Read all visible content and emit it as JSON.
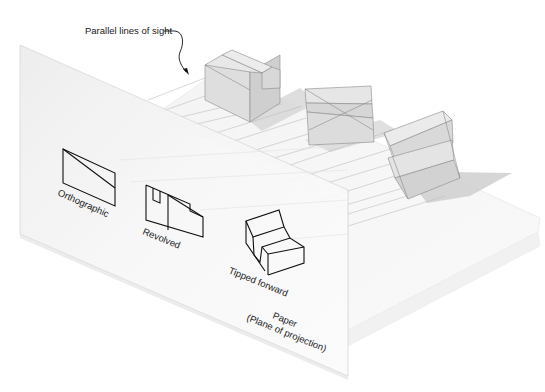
{
  "figure": {
    "callout": {
      "label": "Parallel lines of sight"
    },
    "views": [
      {
        "id": "orthographic",
        "label": "Orthographic"
      },
      {
        "id": "revolved",
        "label": "Revolved"
      },
      {
        "id": "tipped-forward",
        "label": "Tipped forward"
      }
    ],
    "plane": {
      "label_line1": "Paper",
      "label_line2": "(Plane of projection)"
    },
    "colors": {
      "line": "#111111",
      "block_face_light": "#e6e6e6",
      "block_face_mid": "#d4d4d4",
      "block_face_dark": "#c4c4c4",
      "shadow": "#d0d0d0",
      "ground": "#f6f6f6",
      "plane": "#f3f3f3",
      "sight_line": "#bdbdbd"
    }
  }
}
